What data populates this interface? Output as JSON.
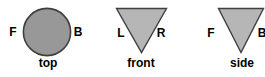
{
  "colors": {
    "background": "#ffffff",
    "circle_fill": "#989898",
    "triangle_fill": "#b6b6b6",
    "shape_stroke": "#3f3f3f",
    "text": "#000000"
  },
  "views": [
    {
      "id": "top",
      "shape": "circle",
      "label": "top",
      "left_letter": "F",
      "right_letter": "B"
    },
    {
      "id": "front",
      "shape": "triangle-down",
      "label": "front",
      "left_letter": "L",
      "right_letter": "R"
    },
    {
      "id": "side",
      "shape": "triangle-down",
      "label": "side",
      "left_letter": "F",
      "right_letter": "B"
    }
  ]
}
